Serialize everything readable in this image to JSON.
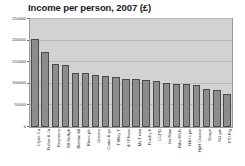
{
  "chart_data": {
    "type": "bar",
    "title": "Income per person, 2007 (£)",
    "xlabel": "",
    "ylabel": "",
    "ylim": [
      0,
      250000
    ],
    "yticks": [
      0,
      50000,
      100000,
      150000,
      200000,
      250000
    ],
    "ytick_labels": [
      "0",
      "50000",
      "100000",
      "150000",
      "200000",
      "250000"
    ],
    "grid": true,
    "legend": false,
    "bar_color": "#8c8c8c",
    "bar_edge_color": "#4a4a4a",
    "plot_background": "#d2d2d2",
    "categories": [
      "Clyde Co",
      "Fisher & Jo",
      "Keynerns",
      "SB Hulkyk",
      "Bieldon Ml",
      "Rines plc",
      "Greens",
      "Cams & gs",
      "T Wley T",
      "A I Phoas",
      "My T tom",
      "Frachy h",
      "CCPD",
      "Go Now",
      "Ribs H'Lfs",
      "Nikt's pis",
      "HpH Ocrose",
      "Drage",
      "SG pin",
      "PTI Ptg"
    ],
    "values": [
      203000,
      173000,
      145000,
      143000,
      126000,
      125000,
      120000,
      117000,
      115000,
      112000,
      110000,
      108000,
      107000,
      103000,
      100000,
      100000,
      98000,
      88000,
      85000,
      77000
    ]
  }
}
